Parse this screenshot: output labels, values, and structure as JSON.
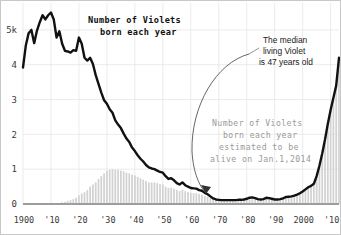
{
  "chart_data": {
    "type": "line",
    "title": "Number of Violets\nborn each year",
    "title_line1": "Number of Violets",
    "title_line2": "born each year",
    "xlabel": "",
    "ylabel": "",
    "xlim": [
      1900,
      2013
    ],
    "ylim": [
      0,
      5.6
    ],
    "grid": true,
    "legend_position": "none",
    "y_tick_labels": [
      "5k",
      "4",
      "3",
      "2",
      "1",
      "0"
    ],
    "y_tick_values": [
      5,
      4,
      3,
      2,
      1,
      0
    ],
    "x_tick_labels": [
      "1900",
      "'10",
      "'20",
      "'30",
      "'40",
      "'50",
      "'60",
      "'70",
      "'80",
      "'90",
      "2000",
      "'10"
    ],
    "x_tick_values": [
      1900,
      1910,
      1920,
      1930,
      1940,
      1950,
      1960,
      1970,
      1980,
      1990,
      2000,
      2010
    ],
    "y_unit_note": "thousands (5k = 5000)",
    "series": [
      {
        "name": "Number of Violets born each year",
        "type": "line",
        "color": "#111111",
        "x": [
          1900,
          1901,
          1902,
          1903,
          1904,
          1905,
          1906,
          1907,
          1908,
          1909,
          1910,
          1911,
          1912,
          1913,
          1914,
          1915,
          1916,
          1917,
          1918,
          1919,
          1920,
          1921,
          1922,
          1923,
          1924,
          1925,
          1926,
          1927,
          1928,
          1929,
          1930,
          1931,
          1932,
          1933,
          1934,
          1935,
          1936,
          1937,
          1938,
          1939,
          1940,
          1941,
          1942,
          1943,
          1944,
          1945,
          1946,
          1947,
          1948,
          1949,
          1950,
          1951,
          1952,
          1953,
          1954,
          1955,
          1956,
          1957,
          1958,
          1959,
          1960,
          1961,
          1962,
          1963,
          1964,
          1965,
          1966,
          1967,
          1968,
          1969,
          1970,
          1971,
          1972,
          1973,
          1974,
          1975,
          1976,
          1977,
          1978,
          1979,
          1980,
          1981,
          1982,
          1983,
          1984,
          1985,
          1986,
          1987,
          1988,
          1989,
          1990,
          1991,
          1992,
          1993,
          1994,
          1995,
          1996,
          1997,
          1998,
          1999,
          2000,
          2001,
          2002,
          2003,
          2004,
          2005,
          2006,
          2007,
          2008,
          2009,
          2010,
          2011,
          2012,
          2013
        ],
        "values": [
          3.92,
          4.55,
          4.9,
          5.0,
          4.62,
          4.98,
          5.22,
          5.42,
          5.3,
          5.42,
          5.5,
          5.3,
          4.78,
          4.96,
          4.6,
          4.4,
          4.38,
          4.35,
          4.42,
          4.4,
          4.78,
          4.6,
          4.2,
          4.12,
          4.2,
          4.02,
          3.7,
          3.45,
          3.2,
          2.98,
          2.88,
          2.72,
          2.62,
          2.4,
          2.28,
          2.18,
          2.02,
          1.88,
          1.78,
          1.62,
          1.52,
          1.4,
          1.3,
          1.22,
          1.12,
          1.05,
          1.02,
          1.0,
          0.96,
          0.92,
          0.9,
          0.8,
          0.72,
          0.74,
          0.68,
          0.6,
          0.56,
          0.62,
          0.54,
          0.5,
          0.46,
          0.45,
          0.44,
          0.4,
          0.38,
          0.32,
          0.28,
          0.22,
          0.16,
          0.13,
          0.12,
          0.11,
          0.11,
          0.11,
          0.11,
          0.11,
          0.11,
          0.12,
          0.12,
          0.13,
          0.15,
          0.18,
          0.19,
          0.17,
          0.14,
          0.13,
          0.14,
          0.18,
          0.17,
          0.15,
          0.13,
          0.13,
          0.14,
          0.16,
          0.2,
          0.21,
          0.22,
          0.24,
          0.27,
          0.31,
          0.36,
          0.42,
          0.48,
          0.52,
          0.58,
          0.8,
          1.1,
          1.45,
          1.85,
          2.3,
          2.7,
          3.05,
          3.4,
          4.2
        ]
      },
      {
        "name": "Number of Violets born each year estimated to be alive on Jan.1,2014",
        "type": "bar",
        "color": "#d2d2d2",
        "x": [
          1900,
          1901,
          1902,
          1903,
          1904,
          1905,
          1906,
          1907,
          1908,
          1909,
          1910,
          1911,
          1912,
          1913,
          1914,
          1915,
          1916,
          1917,
          1918,
          1919,
          1920,
          1921,
          1922,
          1923,
          1924,
          1925,
          1926,
          1927,
          1928,
          1929,
          1930,
          1931,
          1932,
          1933,
          1934,
          1935,
          1936,
          1937,
          1938,
          1939,
          1940,
          1941,
          1942,
          1943,
          1944,
          1945,
          1946,
          1947,
          1948,
          1949,
          1950,
          1951,
          1952,
          1953,
          1954,
          1955,
          1956,
          1957,
          1958,
          1959,
          1960,
          1961,
          1962,
          1963,
          1964,
          1965,
          1966,
          1967,
          1968,
          1969,
          1970,
          1971,
          1972,
          1973,
          1974,
          1975,
          1976,
          1977,
          1978,
          1979,
          1980,
          1981,
          1982,
          1983,
          1984,
          1985,
          1986,
          1987,
          1988,
          1989,
          1990,
          1991,
          1992,
          1993,
          1994,
          1995,
          1996,
          1997,
          1998,
          1999,
          2000,
          2001,
          2002,
          2003,
          2004,
          2005,
          2006,
          2007,
          2008,
          2009,
          2010,
          2011,
          2012,
          2013
        ],
        "values": [
          0.0,
          0.0,
          0.0,
          0.0,
          0.0,
          0.0,
          0.0,
          0.0,
          0.0,
          0.0,
          0.0,
          0.01,
          0.02,
          0.03,
          0.05,
          0.06,
          0.09,
          0.11,
          0.14,
          0.18,
          0.25,
          0.3,
          0.34,
          0.4,
          0.5,
          0.56,
          0.62,
          0.72,
          0.8,
          0.88,
          0.95,
          0.98,
          1.0,
          0.98,
          0.98,
          0.96,
          0.94,
          0.9,
          0.88,
          0.84,
          0.82,
          0.78,
          0.74,
          0.7,
          0.66,
          0.62,
          0.62,
          0.62,
          0.6,
          0.57,
          0.56,
          0.5,
          0.46,
          0.47,
          0.44,
          0.4,
          0.37,
          0.41,
          0.37,
          0.34,
          0.32,
          0.31,
          0.31,
          0.29,
          0.27,
          0.23,
          0.21,
          0.17,
          0.13,
          0.11,
          0.1,
          0.1,
          0.1,
          0.1,
          0.1,
          0.1,
          0.1,
          0.11,
          0.11,
          0.12,
          0.14,
          0.17,
          0.18,
          0.16,
          0.13,
          0.12,
          0.13,
          0.17,
          0.16,
          0.14,
          0.12,
          0.12,
          0.13,
          0.15,
          0.19,
          0.2,
          0.21,
          0.23,
          0.26,
          0.3,
          0.35,
          0.41,
          0.47,
          0.51,
          0.57,
          0.79,
          1.09,
          1.44,
          1.84,
          2.29,
          2.69,
          3.04,
          3.39,
          4.19
        ]
      }
    ],
    "annotations": [
      {
        "id": "median-annotation",
        "text": "The median\nliving Violet\nis 47 years old",
        "lines": [
          "The median",
          "living Violet",
          "is 47 years old"
        ],
        "color": "#1a1a1a",
        "points_to_year": 1966,
        "arrow": true
      },
      {
        "id": "alive-estimate-annotation",
        "text": "Number of Violets\nborn each year\nestimated to be\nalive on Jan.1,2014",
        "lines": [
          "Number of Violets",
          "born each year",
          "estimated to be",
          "alive on Jan.1,2014"
        ],
        "color": "#9a9a9a",
        "arrow": false
      }
    ]
  },
  "colors": {
    "line": "#111111",
    "bars": "#d2d2d2",
    "grid": "#e3e3e3",
    "baseline": "#9d9d9d",
    "annotation_gray": "#9a9a9a",
    "annotation_dark": "#1a1a1a",
    "background": "#ffffff",
    "border": "#c8c8c8"
  }
}
